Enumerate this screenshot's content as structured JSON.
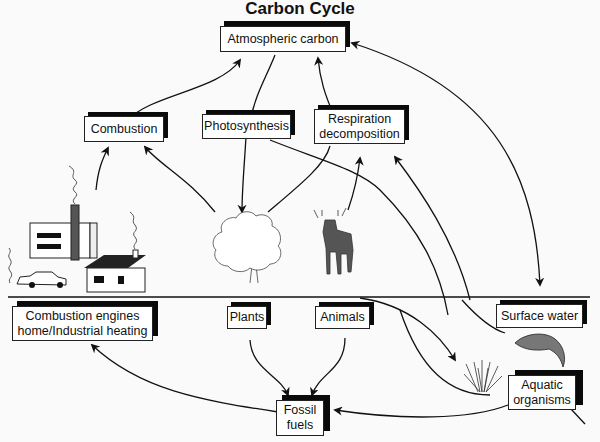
{
  "title": "Carbon Cycle",
  "nodes": {
    "atmospheric_carbon": "Atmospheric carbon",
    "combustion": "Combustion",
    "photosynthesis": "Photosynthesis",
    "respiration": "Respiration\ndecomposition",
    "combustion_engines": "Combustion engines\nhome/Industrial heating",
    "plants": "Plants",
    "animals": "Animals",
    "surface_water": "Surface water",
    "aquatic_organisms": "Aquatic\norganisms",
    "fossil_fuels": "Fossil\nfuels"
  },
  "illustrations": [
    "factory-icon",
    "car-icon",
    "house-icon",
    "tree-icon",
    "deer-icon",
    "fish-icon",
    "seaweed-icon"
  ],
  "colors": {
    "line": "#111111",
    "shadow": "#0a0a0a",
    "box": "#ffffff",
    "background": "#fafafa"
  }
}
